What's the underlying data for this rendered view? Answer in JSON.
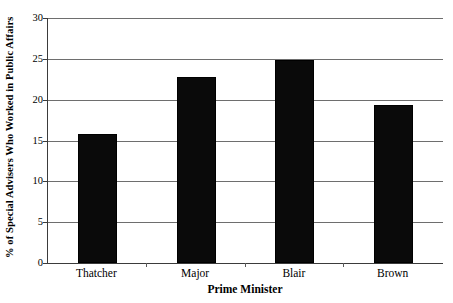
{
  "chart_data": {
    "type": "bar",
    "title": "",
    "subtitle": "",
    "xlabel": "Prime Minister",
    "ylabel": "% of Special Advisers Who Worked in Public Affairs",
    "categories": [
      "Thatcher",
      "Major",
      "Blair",
      "Brown"
    ],
    "values": [
      15.8,
      22.8,
      24.8,
      19.4
    ],
    "ylim": [
      0,
      30
    ],
    "yticks": [
      0,
      5,
      10,
      15,
      20,
      25,
      30
    ],
    "ytick_labels": [
      "0",
      "5",
      "10",
      "15",
      "20",
      "25",
      "30"
    ],
    "grid": "horizontal",
    "legend": "none",
    "bar_color": "#0a0a0a",
    "gridline_color": "#6e6e6e",
    "axis_color": "#3b3b3b",
    "background_color": "#ffffff"
  }
}
